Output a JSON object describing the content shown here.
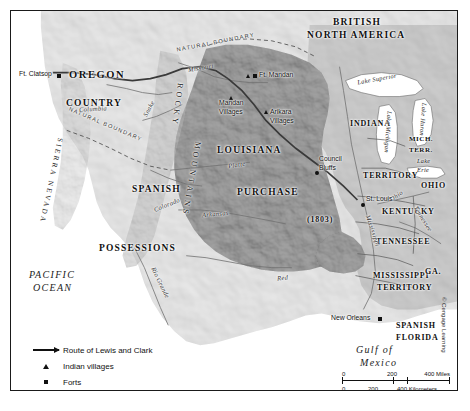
{
  "map": {
    "title_region": "Louisiana Purchase and the Route of Lewis and Clark",
    "colors": {
      "purchase_fill": "#a8a8a8",
      "us_territory_fill": "#d2d2d2",
      "foreign_fill": "#ededed",
      "water_fill": "#ffffff",
      "route_line": "#3a3a3a",
      "frame": "#1a1a1a"
    },
    "regions": [
      {
        "name": "british-north-america",
        "label_line1": "BRITISH",
        "label_line2": "NORTH AMERICA"
      },
      {
        "name": "oregon-country",
        "label_line1": "OREGON",
        "label_line2": "COUNTRY"
      },
      {
        "name": "spanish-possessions",
        "label_line1": "SPANISH",
        "label_line2": "POSSESSIONS"
      },
      {
        "name": "louisiana-purchase",
        "label_line1": "LOUISIANA",
        "label_line2": "PURCHASE",
        "year": "(1803)"
      },
      {
        "name": "indiana-territory",
        "label_line1": "INDIANA",
        "label_line2": "TERRITORY"
      },
      {
        "name": "michigan-territory",
        "label_line1": "MICH.",
        "label_line2": "TERR."
      },
      {
        "name": "mississippi-territory",
        "label_line1": "MISSISSIPPI",
        "label_line2": "TERRITORY"
      },
      {
        "name": "spanish-florida",
        "label_line1": "SPANISH",
        "label_line2": "FLORIDA"
      },
      {
        "name": "ohio",
        "label": "OHIO"
      },
      {
        "name": "kentucky",
        "label": "KENTUCKY"
      },
      {
        "name": "tennessee",
        "label": "TENNESSEE"
      },
      {
        "name": "georgia",
        "label": "GA."
      }
    ],
    "oceans": [
      {
        "name": "pacific-ocean",
        "line1": "PACIFIC",
        "line2": "OCEAN"
      },
      {
        "name": "gulf-of-mexico",
        "line1": "Gulf of",
        "line2": "Mexico"
      }
    ],
    "mountain_ranges": [
      {
        "name": "rocky-mountains",
        "word1": "ROCKY",
        "word2": "MOUNTAINS"
      },
      {
        "name": "sierra-nevada",
        "label": "SIERRA NEVADA"
      }
    ],
    "boundaries": [
      {
        "name": "natural-boundary-north",
        "label": "NATURAL BOUNDARY"
      },
      {
        "name": "natural-boundary-west",
        "label": "NATURAL BOUNDARY"
      }
    ],
    "rivers": [
      {
        "name": "columbia",
        "label": "Columbia"
      },
      {
        "name": "snake",
        "label": "Snake"
      },
      {
        "name": "missouri",
        "label": "Missouri"
      },
      {
        "name": "platte",
        "label": "Platte"
      },
      {
        "name": "arkansas",
        "label": "Arkansas"
      },
      {
        "name": "red",
        "label": "Red"
      },
      {
        "name": "rio-grande",
        "label": "Rio Grande"
      },
      {
        "name": "colorado",
        "label": "Colorado"
      },
      {
        "name": "mississippi",
        "label": "Mississippi"
      },
      {
        "name": "ohio-river",
        "label": "Ohio"
      },
      {
        "name": "tennessee-river",
        "label": "Tennessee"
      }
    ],
    "lakes": [
      {
        "name": "lake-superior",
        "label": "Lake Superior"
      },
      {
        "name": "lake-michigan",
        "label": "Lake Michigan"
      },
      {
        "name": "lake-huron",
        "label": "Lake Huron"
      },
      {
        "name": "lake-erie",
        "line1": "Lake",
        "line2": "Erie"
      }
    ],
    "places": [
      {
        "name": "ft-clatsop",
        "label": "Ft. Clatsop",
        "type": "fort"
      },
      {
        "name": "ft-mandan",
        "label": "Ft. Mandan",
        "type": "fort-and-village"
      },
      {
        "name": "mandan-villages",
        "line1": "Mandan",
        "line2": "Villages",
        "type": "village"
      },
      {
        "name": "arikara-villages",
        "line1": "Arikara",
        "line2": "Villages",
        "type": "village"
      },
      {
        "name": "council-bluffs",
        "line1": "Council",
        "line2": "Bluffs",
        "type": "city"
      },
      {
        "name": "st-louis",
        "label": "St. Louis",
        "type": "city"
      },
      {
        "name": "new-orleans",
        "label": "New Orleans",
        "type": "city"
      }
    ]
  },
  "legend": {
    "items": [
      {
        "icon": "arrow-icon",
        "label": "Route of Lewis and Clark"
      },
      {
        "icon": "triangle-icon",
        "label": "Indian villages"
      },
      {
        "icon": "square-icon",
        "label": "Forts"
      }
    ]
  },
  "scale": {
    "miles": {
      "start": "0",
      "mid": "200",
      "end": "400 Miles"
    },
    "kilometers": {
      "start": "0",
      "mid": "200",
      "end": "400 Kilometers"
    }
  },
  "credit": {
    "text": "© Cengage Learning"
  }
}
